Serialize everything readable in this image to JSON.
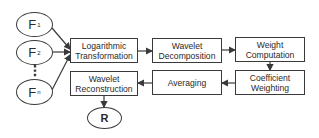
{
  "diagram": {
    "inputs": [
      {
        "label": "F",
        "sub": "1"
      },
      {
        "label": "F",
        "sub": "2"
      },
      {
        "label": "F",
        "sub": "n"
      }
    ],
    "ellipsis": "⋮",
    "output": {
      "label": "R"
    },
    "steps": [
      {
        "id": "log",
        "line1": "Logarithmic",
        "line2": "Transformation"
      },
      {
        "id": "wdec",
        "line1": "Wavelet",
        "line2": "Decomposition"
      },
      {
        "id": "wcomp",
        "line1": "Weight",
        "line2": "Computation"
      },
      {
        "id": "coef",
        "line1": "Coefficient",
        "line2": "Weighting"
      },
      {
        "id": "avg",
        "line1": "Averaging",
        "line2": ""
      },
      {
        "id": "wrec",
        "line1": "Wavelet",
        "line2": "Reconstruction"
      }
    ],
    "flow": [
      "F1,F2,...,Fn -> Logarithmic Transformation",
      "Logarithmic Transformation -> Wavelet Decomposition",
      "Wavelet Decomposition -> Weight Computation",
      "Weight Computation -> Coefficient Weighting",
      "Coefficient Weighting -> Averaging",
      "Averaging -> Wavelet Reconstruction",
      "Wavelet Reconstruction -> R"
    ],
    "colors": {
      "stroke": "#3a3a3a",
      "background": "#ffffff",
      "text": "#2a2a2a"
    }
  }
}
